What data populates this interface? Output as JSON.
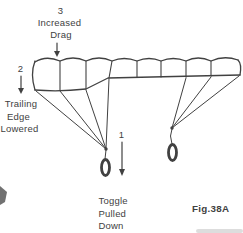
{
  "figure": {
    "caption": "Fig.38A",
    "labels": {
      "increased_drag": {
        "number": "3",
        "line1": "Increased",
        "line2": "Drag"
      },
      "trailing_edge": {
        "number": "2",
        "line1": "Trailing",
        "line2": "Edge",
        "line3": "Lowered"
      },
      "toggle_pulled": {
        "number": "1",
        "line1": "Toggle",
        "line2": "Pulled",
        "line3": "Down"
      }
    },
    "colors": {
      "ink": "#414141",
      "paper": "#ffffff"
    }
  }
}
